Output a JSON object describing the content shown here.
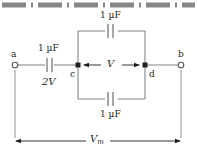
{
  "figure": {
    "background_color": "#ffffff",
    "wire_color": "#878787",
    "text_color": "#231f20",
    "border_color": "#808080"
  },
  "top_border": {
    "style": "dash-dot",
    "color": "#878787"
  },
  "terminals": {
    "left": {
      "label": "a",
      "marker": "open-circle"
    },
    "right": {
      "label": "b",
      "marker": "open-circle"
    }
  },
  "nodes": {
    "left_junction": {
      "label": "c",
      "marker": "filled-dot"
    },
    "right_junction": {
      "label": "d",
      "marker": "filled-dot"
    }
  },
  "capacitors": [
    {
      "id": "series",
      "value": "1 µF",
      "drop": "2V",
      "position": "left-series"
    },
    {
      "id": "top-branch",
      "value": "1 µF",
      "position": "top"
    },
    {
      "id": "bottom-branch",
      "value": "1 µF",
      "position": "bottom"
    }
  ],
  "voltage_labels": {
    "bridge": "V",
    "total": "V",
    "total_subscript": "m"
  },
  "annotations": {
    "bridge_arrow": "double-headed",
    "dimension_arrow": "double-headed"
  }
}
